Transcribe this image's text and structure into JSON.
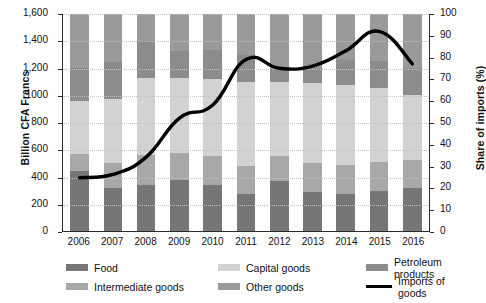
{
  "chart_data": {
    "type": "bar",
    "title": "",
    "subtitle": "",
    "xlabel": "",
    "ylabel": "Billion CFA Francs",
    "y2label": "Share of imports (%)",
    "categories": [
      "2006",
      "2007",
      "2008",
      "2009",
      "2010",
      "2011",
      "2012",
      "2013",
      "2014",
      "2015",
      "2016"
    ],
    "ylim": [
      0,
      1600
    ],
    "y2lim": [
      0,
      100
    ],
    "yticks": [
      0,
      200,
      400,
      600,
      800,
      1000,
      1200,
      1400,
      1600
    ],
    "ytick_labels": [
      "0",
      "200",
      "400",
      "600",
      "800",
      "1000",
      "1,200",
      "1,400",
      "1,600"
    ],
    "y2ticks": [
      0,
      10,
      20,
      30,
      40,
      50,
      60,
      70,
      80,
      90,
      100
    ],
    "y2tick_labels": [
      "0",
      "10",
      "20",
      "30",
      "40",
      "50",
      "60",
      "70",
      "80",
      "90",
      "100"
    ],
    "grid": true,
    "legend_position": "bottom",
    "stacked": true,
    "series": [
      {
        "name": "Food",
        "color": "#767676",
        "values": [
          445,
          320,
          340,
          375,
          340,
          275,
          370,
          290,
          270,
          295,
          320
        ]
      },
      {
        "name": "Intermediate goods",
        "color": "#a8a8a8",
        "values": [
          125,
          185,
          220,
          200,
          210,
          205,
          185,
          210,
          215,
          215,
          200
        ]
      },
      {
        "name": "Capital goods",
        "color": "#d2d2d2",
        "values": [
          390,
          470,
          570,
          555,
          570,
          620,
          545,
          590,
          590,
          545,
          485
        ]
      },
      {
        "name": "Petroleum products",
        "color": "#8c8c8c",
        "values": [
          240,
          275,
          270,
          200,
          215,
          200,
          100,
          110,
          185,
          200,
          195
        ]
      },
      {
        "name": "Other goods",
        "color": "#9a9a9a",
        "values": [
          400,
          350,
          200,
          270,
          265,
          300,
          400,
          400,
          340,
          345,
          400
        ]
      }
    ],
    "line_series": {
      "name": "Imports of goods",
      "color": "#000000",
      "axis": "right",
      "unit": "%",
      "values": [
        24.5,
        26,
        34,
        52,
        58,
        79,
        75,
        76,
        83,
        92,
        77
      ]
    }
  },
  "legend": {
    "items": [
      {
        "label": "Food",
        "swatch": "#767676",
        "type": "box"
      },
      {
        "label": "Intermediate goods",
        "swatch": "#a8a8a8",
        "type": "box"
      },
      {
        "label": "Capital goods",
        "swatch": "#d2d2d2",
        "type": "box"
      },
      {
        "label": "Petroleum products",
        "swatch": "#8c8c8c",
        "type": "box"
      },
      {
        "label": "Other goods",
        "swatch": "#9a9a9a",
        "type": "box"
      },
      {
        "label": "Imports of goods",
        "swatch": "#000000",
        "type": "line"
      }
    ]
  }
}
